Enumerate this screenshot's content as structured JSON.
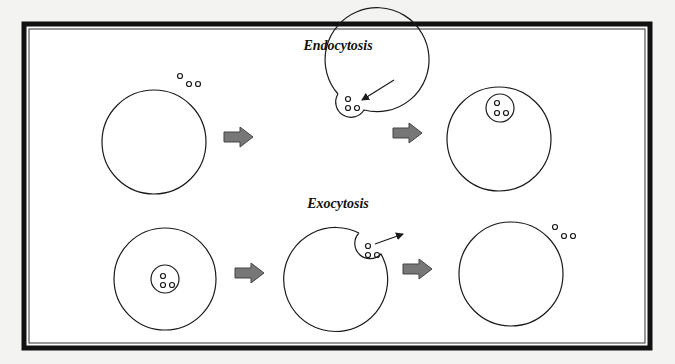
{
  "diagram": {
    "colors": {
      "background": "#f3f3f1",
      "panel": "#ffffff",
      "frame": "#111111",
      "stroke": "#1a1a1a",
      "arrow_fill": "#777777",
      "arrow_stroke": "#444444"
    },
    "sections": [
      {
        "title": "Endocytosis",
        "stages": [
          {
            "label": "cell with particles outside"
          },
          {
            "label": "membrane invaginates around particles"
          },
          {
            "label": "vesicle with particles inside cell"
          }
        ]
      },
      {
        "title": "Exocytosis",
        "stages": [
          {
            "label": "vesicle with particles inside cell"
          },
          {
            "label": "vesicle fuses with membrane releasing particles"
          },
          {
            "label": "particles outside cell"
          }
        ]
      }
    ]
  }
}
